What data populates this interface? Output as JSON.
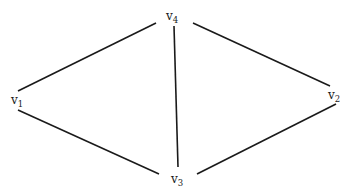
{
  "diagram": {
    "type": "undirected-graph",
    "vertices": [
      {
        "id": "v1",
        "base": "v",
        "sub": "1",
        "x": 11,
        "y": 104
      },
      {
        "id": "v2",
        "base": "v",
        "sub": "2",
        "x": 328,
        "y": 99
      },
      {
        "id": "v3",
        "base": "v",
        "sub": "3",
        "x": 171,
        "y": 183
      },
      {
        "id": "v4",
        "base": "v",
        "sub": "4",
        "x": 166,
        "y": 20
      }
    ],
    "edges": [
      {
        "from": "v4",
        "to": "v1",
        "x1": 156,
        "y1": 23,
        "x2": 18,
        "y2": 91
      },
      {
        "from": "v4",
        "to": "v3",
        "x1": 174,
        "y1": 26,
        "x2": 178,
        "y2": 167
      },
      {
        "from": "v4",
        "to": "v2",
        "x1": 193,
        "y1": 23,
        "x2": 330,
        "y2": 86
      },
      {
        "from": "v1",
        "to": "v3",
        "x1": 18,
        "y1": 110,
        "x2": 159,
        "y2": 174
      },
      {
        "from": "v2",
        "to": "v3",
        "x1": 336,
        "y1": 104,
        "x2": 197,
        "y2": 174
      }
    ],
    "colors": {
      "stroke": "#1a1a1a",
      "background": "#ffffff"
    }
  }
}
